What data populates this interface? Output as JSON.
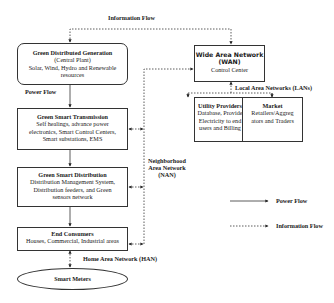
{
  "top_label": "Information Flow",
  "nodes": {
    "generation": {
      "title": "Green Distributed Generation",
      "lines": [
        "(Central Plant)",
        "Solar, Wind, Hydro and Renewable",
        "resources"
      ]
    },
    "transmission": {
      "title": "Green Smart Transmission",
      "lines": [
        "Self healings, advance power",
        "electronics, Smart Control Centers,",
        "Smart substations, EMS"
      ]
    },
    "distribution": {
      "title": "Green Smart Distribution",
      "lines": [
        "Distribution Management System,",
        "Distribution feeders, and Green",
        "sensors network"
      ]
    },
    "consumers": {
      "title": "End Consumers",
      "lines": [
        "Houses, Commercial, Industrial areas"
      ]
    },
    "meters": {
      "title": "Smart Meters"
    },
    "wan": {
      "title_lines": [
        "Wide Area Network",
        "(WAN)"
      ],
      "subtitle": "Control Center"
    },
    "utility": {
      "title": "Utility Providers",
      "lines": [
        "Database, Provide",
        "Electricity to end",
        "users and Billing"
      ]
    },
    "market": {
      "title": "Market",
      "lines": [
        "Retailers/Aggreg",
        "ators and Traders"
      ]
    }
  },
  "labels": {
    "power_flow": "Power Flow",
    "lan": "Local Area Networks (LANs)",
    "nan": [
      "Neighborhood",
      "Area Network",
      "(NAN)"
    ],
    "han": "Home Area Network (HAN)"
  },
  "legend": [
    {
      "style": "solid",
      "label": "Power Flow"
    },
    {
      "style": "dashed",
      "label": "Information Flow"
    }
  ]
}
